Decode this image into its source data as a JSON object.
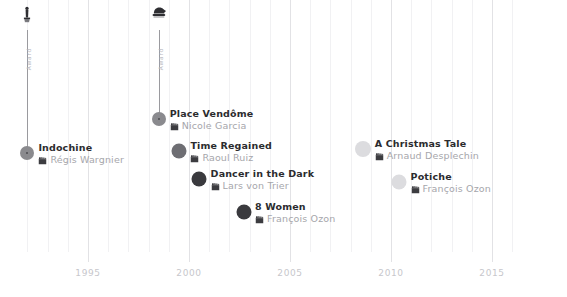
{
  "chart_data": {
    "type": "scatter",
    "title": "",
    "subtitle": "",
    "xlabel": "",
    "ylabel": "",
    "xlim": [
      1991.4,
      2016.6
    ],
    "grid": true,
    "legend_position": "none",
    "axis": {
      "tick_labels": [
        "1995",
        "2000",
        "2005",
        "2010",
        "2015"
      ],
      "tick_values": [
        1995,
        2000,
        2005,
        2010,
        2015
      ],
      "minor_tick_step": 1
    },
    "points": [
      {
        "title": "Indochine",
        "director": "Régis Wargnier",
        "x": 1992,
        "y": 153,
        "dot_color": "#8a8a8e",
        "dot_size": 14,
        "has_core": true,
        "award": {
          "icon": "oscar-statuette-icon",
          "label": "Award",
          "stem_top": 30,
          "stem_color": "#9a9a9e"
        }
      },
      {
        "title": "Place Vendôme",
        "director": "Nicole Garcia",
        "x": 1998.5,
        "y": 119,
        "dot_color": "#8a8a8e",
        "dot_size": 14,
        "has_core": true,
        "award": {
          "icon": "award-trophy-icon",
          "label": "Award",
          "stem_top": 30,
          "stem_color": "#9a9a9e"
        }
      },
      {
        "title": "Time Regained",
        "director": "Raoul Ruiz",
        "x": 1999.5,
        "y": 151,
        "dot_color": "#6e6e73",
        "dot_size": 15,
        "has_core": false,
        "award": null
      },
      {
        "title": "Dancer in the Dark",
        "director": "Lars von Trier",
        "x": 2000.5,
        "y": 179,
        "dot_color": "#3a3a3e",
        "dot_size": 15,
        "has_core": false,
        "award": null
      },
      {
        "title": "8 Women",
        "director": "François Ozon",
        "x": 2002.7,
        "y": 212,
        "dot_color": "#3a3a3e",
        "dot_size": 15,
        "has_core": false,
        "award": null
      },
      {
        "title": "A Christmas Tale",
        "director": "Arnaud Desplechin",
        "x": 2008.6,
        "y": 149,
        "dot_color": "#dcdcdf",
        "dot_size": 16,
        "has_core": false,
        "award": null
      },
      {
        "title": "Potiche",
        "director": "François Ozon",
        "x": 2010.4,
        "y": 182,
        "dot_color": "#dcdcdf",
        "dot_size": 15,
        "has_core": false,
        "award": null
      }
    ]
  },
  "icons": {
    "clapperboard": "clapperboard-icon",
    "oscar": "oscar-statuette-icon",
    "trophy": "award-trophy-icon"
  },
  "colors": {
    "background": "#ffffff",
    "title_text": "#2b2b2e",
    "director_text": "#a6a6ab",
    "axis_text": "#c7c7cc",
    "gridline_minor": "#f1f1f3",
    "gridline_major": "#e2e2e5",
    "stem": "#9a9a9e"
  },
  "axis_geometry": {
    "x_1995_px": 88,
    "px_per_year": 20.2,
    "axis_label_y": 268,
    "grid_bottom": 258
  }
}
